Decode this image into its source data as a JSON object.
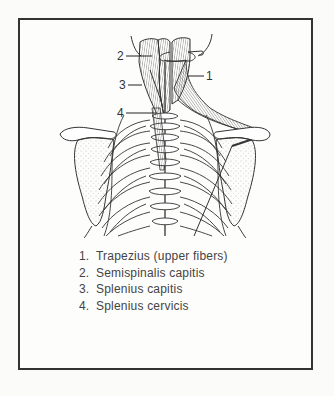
{
  "figure": {
    "callouts": [
      {
        "number": "1",
        "x": 206,
        "y": 70
      },
      {
        "number": "2",
        "x": 117,
        "y": 50
      },
      {
        "number": "3",
        "x": 119,
        "y": 79
      },
      {
        "number": "4",
        "x": 117,
        "y": 107
      }
    ],
    "line_color": "#333333",
    "stipple_color": "#777777"
  },
  "legend": {
    "items": [
      {
        "number": "1.",
        "label": "Trapezius (upper fibers)"
      },
      {
        "number": "2.",
        "label": "Semispinalis capitis"
      },
      {
        "number": "3.",
        "label": "Splenius capitis"
      },
      {
        "number": "4.",
        "label": "Splenius cervicis"
      }
    ]
  }
}
